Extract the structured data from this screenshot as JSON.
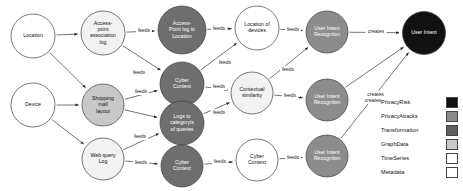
{
  "diagram": {
    "nodes": [
      {
        "id": "location",
        "label": "Location",
        "lines": [
          "Location"
        ],
        "x": 33,
        "y": 36,
        "r": 22,
        "fill": "#ffffff",
        "text": "#111111",
        "category": "Metadata"
      },
      {
        "id": "device",
        "label": "Device",
        "lines": [
          "Device"
        ],
        "x": 33,
        "y": 105,
        "r": 22,
        "fill": "#ffffff",
        "text": "#111111",
        "category": "Metadata"
      },
      {
        "id": "ap-assoc-log",
        "label": "Access-point association log",
        "lines": [
          "Access-",
          "point",
          "association",
          "log"
        ],
        "x": 103,
        "y": 33,
        "r": 22,
        "fill": "#f2f2f2",
        "text": "#111111",
        "category": "TimeSeries"
      },
      {
        "id": "shopping-mall",
        "label": "Shopping mall layout",
        "lines": [
          "Shopping",
          "mall",
          "layout"
        ],
        "x": 103,
        "y": 105,
        "r": 21,
        "fill": "#c8c8c8",
        "text": "#111111",
        "category": "GraphData"
      },
      {
        "id": "web-query-log",
        "label": "Web query Log",
        "lines": [
          "Web query",
          "Log"
        ],
        "x": 103,
        "y": 159,
        "r": 21,
        "fill": "#f2f2f2",
        "text": "#111111",
        "category": "TimeSeries"
      },
      {
        "id": "ap-log-to-loc",
        "label": "Access-Point log to Location",
        "lines": [
          "Access-",
          "Point log to",
          "Location"
        ],
        "x": 182,
        "y": 30,
        "r": 24,
        "fill": "#6e6e6e",
        "text": "#ffffff",
        "category": "Transformation"
      },
      {
        "id": "cyber-context-t1",
        "label": "Cyber Context",
        "lines": [
          "Cyber",
          "Context"
        ],
        "x": 182,
        "y": 84,
        "r": 22,
        "fill": "#6e6e6e",
        "text": "#ffffff",
        "category": "Transformation"
      },
      {
        "id": "logs-to-categoryis",
        "label": "Logs to categoryis of queries",
        "lines": [
          "Logs to",
          "categoryis",
          "of queries"
        ],
        "x": 182,
        "y": 123,
        "r": 22,
        "fill": "#6e6e6e",
        "text": "#ffffff",
        "category": "Transformation"
      },
      {
        "id": "cyber-context-t2",
        "label": "Cyber Context",
        "lines": [
          "Cyber",
          "Context"
        ],
        "x": 182,
        "y": 166,
        "r": 21,
        "fill": "#6e6e6e",
        "text": "#ffffff",
        "category": "Transformation"
      },
      {
        "id": "location-of-dev",
        "label": "Location of devices",
        "lines": [
          "Location of",
          "devices"
        ],
        "x": 257,
        "y": 28,
        "r": 22,
        "fill": "#ffffff",
        "text": "#111111",
        "category": "Metadata"
      },
      {
        "id": "contextual-sim",
        "label": "Contextual similarity",
        "lines": [
          "Contextual",
          "similarity"
        ],
        "x": 252,
        "y": 93,
        "r": 21,
        "fill": "#f2f2f2",
        "text": "#111111",
        "category": "TimeSeries"
      },
      {
        "id": "cyber-context-out",
        "label": "Cyber Context",
        "lines": [
          "Cyber",
          "Context"
        ],
        "x": 257,
        "y": 160,
        "r": 21,
        "fill": "#ffffff",
        "text": "#111111",
        "category": "Metadata"
      },
      {
        "id": "uir-1",
        "label": "User Intent Recogniton",
        "lines": [
          "User Intent",
          "Recogniton"
        ],
        "x": 327,
        "y": 32,
        "r": 21,
        "fill": "#8c8c8c",
        "text": "#ffffff",
        "category": "PrivacyAttacks"
      },
      {
        "id": "uir-2",
        "label": "User Intent Recogniton",
        "lines": [
          "User Intent",
          "Recogniton"
        ],
        "x": 327,
        "y": 100,
        "r": 21,
        "fill": "#8c8c8c",
        "text": "#ffffff",
        "category": "PrivacyAttacks"
      },
      {
        "id": "uir-3",
        "label": "User Intent Recogniton",
        "lines": [
          "User Intent",
          "Recogniton"
        ],
        "x": 327,
        "y": 156,
        "r": 21,
        "fill": "#8c8c8c",
        "text": "#ffffff",
        "category": "PrivacyAttacks"
      },
      {
        "id": "user-intent",
        "label": "User Intent",
        "lines": [
          "User Intent"
        ],
        "x": 424,
        "y": 33,
        "r": 21.5,
        "fill": "#111111",
        "text": "#ffffff",
        "category": "PrivacyRisk"
      }
    ],
    "edges": [
      {
        "from": "location",
        "to": "ap-assoc-log",
        "label": "",
        "lx": 0,
        "ly": 0
      },
      {
        "from": "location",
        "to": "shopping-mall",
        "label": "",
        "lx": 0,
        "ly": 0
      },
      {
        "from": "device",
        "to": "shopping-mall",
        "label": "",
        "lx": 0,
        "ly": 0
      },
      {
        "from": "device",
        "to": "web-query-log",
        "label": "",
        "lx": 0,
        "ly": 0
      },
      {
        "from": "ap-assoc-log",
        "to": "ap-log-to-loc",
        "label": "feeds",
        "lx": 144,
        "ly": 31
      },
      {
        "from": "ap-assoc-log",
        "to": "cyber-context-t1",
        "label": "feeds",
        "lx": 139,
        "ly": 73
      },
      {
        "from": "shopping-mall",
        "to": "cyber-context-t1",
        "label": "feeds",
        "lx": 141,
        "ly": 92
      },
      {
        "from": "shopping-mall",
        "to": "logs-to-categoryis",
        "label": "",
        "lx": 0,
        "ly": 0
      },
      {
        "from": "web-query-log",
        "to": "logs-to-categoryis",
        "label": "feeds",
        "lx": 140,
        "ly": 137
      },
      {
        "from": "web-query-log",
        "to": "cyber-context-t2",
        "label": "feeds",
        "lx": 141,
        "ly": 163
      },
      {
        "from": "ap-log-to-loc",
        "to": "location-of-dev",
        "label": "feeds",
        "lx": 219,
        "ly": 29
      },
      {
        "from": "cyber-context-t1",
        "to": "location-of-dev",
        "label": "feeds",
        "lx": 225,
        "ly": 63
      },
      {
        "from": "cyber-context-t1",
        "to": "contextual-sim",
        "label": "feeds",
        "lx": 219,
        "ly": 87
      },
      {
        "from": "logs-to-categoryis",
        "to": "contextual-sim",
        "label": "feeds",
        "lx": 219,
        "ly": 113
      },
      {
        "from": "cyber-context-t2",
        "to": "cyber-context-out",
        "label": "feeds",
        "lx": 220,
        "ly": 162
      },
      {
        "from": "location-of-dev",
        "to": "uir-1",
        "label": "feeds",
        "lx": 293,
        "ly": 30
      },
      {
        "from": "contextual-sim",
        "to": "uir-1",
        "label": "feeds",
        "lx": 288,
        "ly": 70
      },
      {
        "from": "contextual-sim",
        "to": "uir-2",
        "label": "feeds",
        "lx": 290,
        "ly": 96
      },
      {
        "from": "cyber-context-out",
        "to": "uir-3",
        "label": "feeds",
        "lx": 293,
        "ly": 158
      },
      {
        "from": "uir-1",
        "to": "user-intent",
        "label": "creates",
        "lx": 376,
        "ly": 32
      },
      {
        "from": "uir-2",
        "to": "user-intent",
        "label": "creates",
        "lx": 373,
        "ly": 101
      },
      {
        "from": "uir-3",
        "to": "user-intent",
        "label": "creates",
        "lx": 0,
        "ly": 0
      }
    ],
    "legend": {
      "items": [
        {
          "label": "PrivacyRisk",
          "color": "#111111"
        },
        {
          "label": "PrivacyAttacks",
          "color": "#8c8c8c"
        },
        {
          "label": "Transformation",
          "color": "#5f5f5f"
        },
        {
          "label": "GraphData",
          "color": "#c8c8c8"
        },
        {
          "label": "TimeSeries",
          "color": "#ffffff"
        },
        {
          "label": "Metadata",
          "color": "#ffffff"
        }
      ]
    }
  }
}
